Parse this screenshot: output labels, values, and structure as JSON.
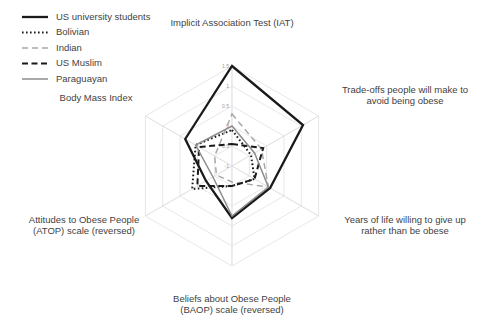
{
  "chart_data": {
    "type": "radar",
    "title": "",
    "categories": [
      "Implicit Association Test (IAT)",
      "Trade-offs people will make to avoid being obese",
      "Years of life willing to give up rather than be obese",
      "Beliefs about Obese People (BAOP) scale (reversed)",
      "Attitudes to Obese People (ATOP) scale (reversed)",
      "Body Mass Index"
    ],
    "category_lines": [
      [
        "Implicit Association Test (IAT)"
      ],
      [
        "Trade-offs people will make to",
        "avoid being obese"
      ],
      [
        "Years of life willing to give up",
        "rather than be obese"
      ],
      [
        "Beliefs about Obese People",
        "(BAOP) scale (reversed)"
      ],
      [
        "Attitudes to Obese People",
        "(ATOP) scale (reversed)"
      ],
      [
        "Body Mass Index"
      ]
    ],
    "rlim": [
      -1,
      1.5
    ],
    "rticks": [
      -1,
      -0.5,
      0,
      0.5,
      1,
      1.5
    ],
    "rtick_labels": [
      "-1",
      "-0.5",
      "0",
      "0.5",
      "1",
      "1.5"
    ],
    "grid": true,
    "legend_position": "top-left",
    "series": [
      {
        "name": "US university students",
        "style": "solid-thick-black",
        "color": "#1a1a1a",
        "values": [
          1.5,
          1.05,
          0.1,
          0.3,
          -0.25,
          0.35
        ]
      },
      {
        "name": "Bolivian",
        "style": "dotted-black",
        "color": "#1a1a1a",
        "values": [
          -0.1,
          -0.45,
          -0.35,
          -0.5,
          0.15,
          0.05
        ]
      },
      {
        "name": "Indian",
        "style": "dashed-gray",
        "color": "#a8a8a8",
        "values": [
          0.3,
          -0.15,
          0.05,
          -0.6,
          -0.55,
          -0.5
        ]
      },
      {
        "name": "US Muslim",
        "style": "dashed-black",
        "color": "#1a1a1a",
        "values": [
          -0.45,
          -0.1,
          -0.35,
          -0.5,
          0.0,
          -0.05
        ]
      },
      {
        "name": "Paraguayan",
        "style": "solid-gray",
        "color": "#8c8c8c",
        "values": [
          0.0,
          -0.35,
          0.05,
          0.25,
          -0.45,
          0.05
        ]
      }
    ]
  },
  "legend": {
    "items": [
      {
        "label": "US university students"
      },
      {
        "label": "Bolivian"
      },
      {
        "label": "Indian"
      },
      {
        "label": "US Muslim"
      },
      {
        "label": "Paraguayan"
      }
    ]
  }
}
